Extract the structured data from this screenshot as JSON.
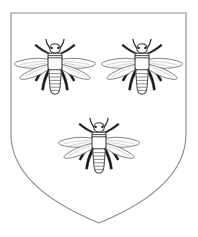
{
  "image": {
    "title": "Heraldic Shield with Three Bees",
    "kind": "coat-of-arms-illustration",
    "blazon": "Argent, three bees proper",
    "background_color": "#ffffff",
    "width": 198,
    "height": 237
  },
  "shield": {
    "name": "heraldic-shield",
    "field_label": "Argent",
    "field_color": "#ffffff",
    "outline_color": "#8a8a8a",
    "outline_width": 1.1,
    "shape": "heater",
    "geometry": {
      "top_left_x": 11,
      "top_right_x": 186,
      "top_y": 13,
      "straight_side_bottom_y": 140,
      "point_x": 99,
      "point_y": 223
    }
  },
  "charges": {
    "label": "Three bees",
    "count": 3,
    "arrangement": "two-and-one",
    "items": [
      {
        "name": "bee-charge-dexter-chief",
        "position_label": "Dexter chief",
        "center_x": 55,
        "center_y": 71,
        "scale": 1.0,
        "rotation": 0
      },
      {
        "name": "bee-charge-sinister-chief",
        "position_label": "Sinister chief",
        "center_x": 142,
        "center_y": 71,
        "scale": 1.0,
        "rotation": 0
      },
      {
        "name": "bee-charge-base",
        "position_label": "Base",
        "center_x": 99,
        "center_y": 150,
        "scale": 1.0,
        "rotation": 0
      }
    ]
  },
  "bee_anatomy": {
    "parts": [
      "head",
      "antennae",
      "eyes",
      "thorax",
      "thorax-stripes",
      "forewing-left",
      "hindwing-left",
      "forewing-right",
      "hindwing-right",
      "wing-veins",
      "legs",
      "abdomen",
      "abdomen-segments"
    ],
    "abdomen_segment_count": 6,
    "wing_pairs": 2,
    "leg_count": 6,
    "colors": {
      "body_stroke": "#4e4e52",
      "wing_fill": "#fcfcfc",
      "wing_stroke": "#6e6e74",
      "wing_vein": "#aeaeb4",
      "leg_fill": "#18181a",
      "antenna_stroke": "#232327",
      "eye_fill": "#1d1d20"
    }
  }
}
